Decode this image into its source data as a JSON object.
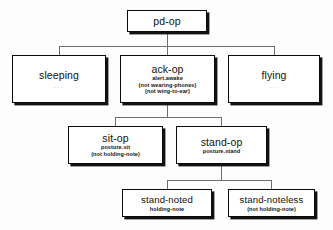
{
  "diagram": {
    "type": "hierarchical-tree",
    "title_node": "pd-op",
    "nodes": [
      {
        "id": "pd-op",
        "title": "pd-op",
        "subs": [],
        "ellipsis": "",
        "x": 127,
        "y": 10,
        "w": 80,
        "h": 22,
        "title_size": "normal"
      },
      {
        "id": "sleeping",
        "title": "sleeping",
        "subs": [],
        "ellipsis": "...",
        "x": 12,
        "y": 55,
        "w": 94,
        "h": 48,
        "title_size": "normal"
      },
      {
        "id": "ack-op",
        "title": "ack-op",
        "subs": [
          "alert.awake",
          "(not wearing-phones)",
          "(not wing-to-ear)"
        ],
        "ellipsis": "",
        "x": 120,
        "y": 55,
        "w": 95,
        "h": 48,
        "title_size": "normal"
      },
      {
        "id": "flying",
        "title": "flying",
        "subs": [],
        "ellipsis": "...",
        "x": 228,
        "y": 55,
        "w": 92,
        "h": 48,
        "title_size": "normal"
      },
      {
        "id": "sit-op",
        "title": "sit-op",
        "subs": [
          "posture.sit",
          "(not holding-note)"
        ],
        "ellipsis": "",
        "x": 68,
        "y": 126,
        "w": 95,
        "h": 38,
        "title_size": "normal"
      },
      {
        "id": "stand-op",
        "title": "stand-op",
        "subs": [
          "posture.stand"
        ],
        "ellipsis": "",
        "x": 176,
        "y": 126,
        "w": 91,
        "h": 38,
        "title_size": "normal"
      },
      {
        "id": "stand-noted",
        "title": "stand-noted",
        "subs": [
          "holding-note"
        ],
        "ellipsis": "",
        "x": 122,
        "y": 189,
        "w": 90,
        "h": 28,
        "title_size": "small"
      },
      {
        "id": "stand-noteless",
        "title": "stand-noteless",
        "subs": [
          "(not holding-note)"
        ],
        "ellipsis": "",
        "x": 228,
        "y": 189,
        "w": 87,
        "h": 28,
        "title_size": "small"
      }
    ],
    "edges": [
      {
        "from": "pd-op",
        "to": "sleeping"
      },
      {
        "from": "pd-op",
        "to": "ack-op"
      },
      {
        "from": "pd-op",
        "to": "flying"
      },
      {
        "from": "ack-op",
        "to": "sit-op"
      },
      {
        "from": "ack-op",
        "to": "stand-op"
      },
      {
        "from": "stand-op",
        "to": "stand-noted"
      },
      {
        "from": "stand-op",
        "to": "stand-noteless"
      }
    ],
    "connector_color": "#6e6e6e",
    "border_color": "#0b0b0b",
    "shadow_color": "#121212",
    "node_fill": "#ffffff",
    "background_color": "#fdfdfd"
  }
}
